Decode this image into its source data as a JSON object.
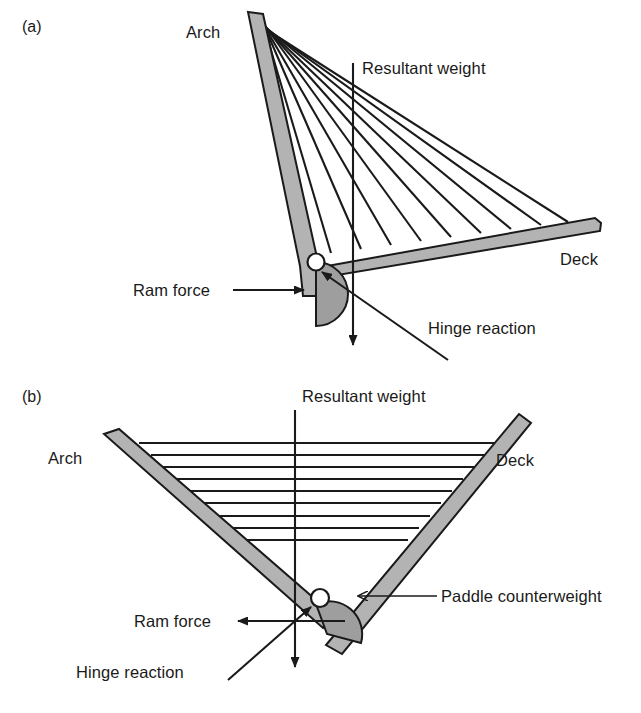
{
  "figure": {
    "background_color": "#ffffff",
    "ink_color": "#1a1a1a",
    "member_fill": "#b3b3b3",
    "paddle_fill": "#9e9e9e",
    "hinge_fill": "#ffffff"
  },
  "panels": [
    {
      "tag": "(a)",
      "description": "Swing bridge leaf shown in closed position with inclined arch and horizontal deck",
      "labels": {
        "arch": "Arch",
        "deck": "Deck",
        "resultant_weight": "Resultant weight",
        "ram_force": "Ram force",
        "hinge_reaction": "Hinge reaction"
      },
      "cable_count": 9,
      "cable_orientation": "fan",
      "ram_force_direction": "right",
      "resultant_weight_direction": "down"
    },
    {
      "tag": "(b)",
      "description": "Swing bridge leaf shown rotated open, arch and deck forming a V with paddle counterweight at hinge",
      "labels": {
        "arch": "Arch",
        "deck": "Deck",
        "resultant_weight": "Resultant weight",
        "ram_force": "Ram force",
        "hinge_reaction": "Hinge reaction",
        "paddle_counterweight": "Paddle counterweight"
      },
      "cable_count": 9,
      "cable_orientation": "horizontal",
      "ram_force_direction": "left",
      "resultant_weight_direction": "down"
    }
  ]
}
